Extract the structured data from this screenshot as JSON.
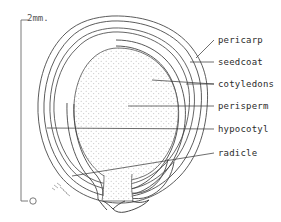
{
  "figure": {
    "type": "botanical-line-drawing",
    "background_color": "#ffffff",
    "ink_color": "#3a3a3a",
    "stipple_color": "#b9b9b9"
  },
  "scale_bar": {
    "name": "scale-bar",
    "top_label": "2mm.",
    "bottom_label": "0",
    "orientation": "vertical",
    "units": "mm",
    "range": [
      0,
      2
    ]
  },
  "labels": [
    {
      "id": "pericarp",
      "text": "pericarp",
      "x": 218,
      "y": 41
    },
    {
      "id": "seedcoat",
      "text": "seedcoat",
      "x": 218,
      "y": 63
    },
    {
      "id": "cotyledons",
      "text": "cotyledons",
      "x": 218,
      "y": 85
    },
    {
      "id": "perisperm",
      "text": "perisperm",
      "x": 218,
      "y": 107
    },
    {
      "id": "hypocotyl",
      "text": "hypocotyl",
      "x": 218,
      "y": 130
    },
    {
      "id": "radicle",
      "text": "radicle",
      "x": 218,
      "y": 154
    }
  ],
  "annotation": {
    "name": "handwritten-note",
    "text": "",
    "note": "small illegible pencil hatching near lower-left margin"
  },
  "structures": [
    {
      "id": "pericarp",
      "description": "outermost double-line fruit wall enclosing the seed"
    },
    {
      "id": "seedcoat",
      "description": "thin testa layer just inside the pericarp"
    },
    {
      "id": "cotyledons",
      "description": "curved embryo leaves forming the ring on the right"
    },
    {
      "id": "perisperm",
      "description": "large central stippled storage tissue"
    },
    {
      "id": "hypocotyl",
      "description": "embryo axis forming the ring on the left"
    },
    {
      "id": "radicle",
      "description": "embryonic root tip at the base of the seed"
    }
  ]
}
